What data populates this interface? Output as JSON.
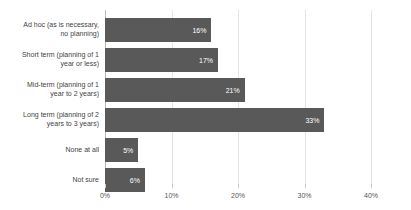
{
  "chart_data": {
    "type": "bar",
    "orientation": "horizontal",
    "title": "",
    "subtitle": "",
    "xlabel": "",
    "ylabel": "",
    "xlim": [
      0,
      40
    ],
    "grid": true,
    "legend": false,
    "value_suffix": "%",
    "bar_color": "#595959",
    "gridline_color": "#e4e4e4",
    "axis_color": "#b9b9b9",
    "label_color": "#3f3f3f",
    "value_label_color": "#ffffff",
    "categories": [
      "Ad hoc (as is necessary,\nno planning)",
      "Short term (planning of 1\nyear or less)",
      "Mid-term (planning of 1\nyear to 2 years)",
      "Long term (planning of 2\nyears to 3 years)",
      "None at all",
      "Not sure"
    ],
    "values": [
      16,
      17,
      21,
      33,
      5,
      6
    ],
    "value_labels": [
      "16%",
      "17%",
      "21%",
      "33%",
      "5%",
      "6%"
    ],
    "xticks": [
      0,
      10,
      20,
      30,
      40
    ],
    "xtick_labels": [
      "0%",
      "10%",
      "20%",
      "30%",
      "40%"
    ]
  }
}
